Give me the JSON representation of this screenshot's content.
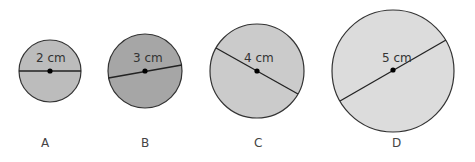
{
  "figure": {
    "circles": [
      {
        "id": "A",
        "caption": "A",
        "diameter_label": "2 cm",
        "fill": "#bcbcbc"
      },
      {
        "id": "B",
        "caption": "B",
        "diameter_label": "3 cm",
        "fill": "#a6a6a6"
      },
      {
        "id": "C",
        "caption": "C",
        "diameter_label": "4 cm",
        "fill": "#cbcbcb"
      },
      {
        "id": "D",
        "caption": "D",
        "diameter_label": "5 cm",
        "fill": "#dcdcdc"
      }
    ],
    "stroke_color": "#333333",
    "center_dot_color": "#000000"
  }
}
